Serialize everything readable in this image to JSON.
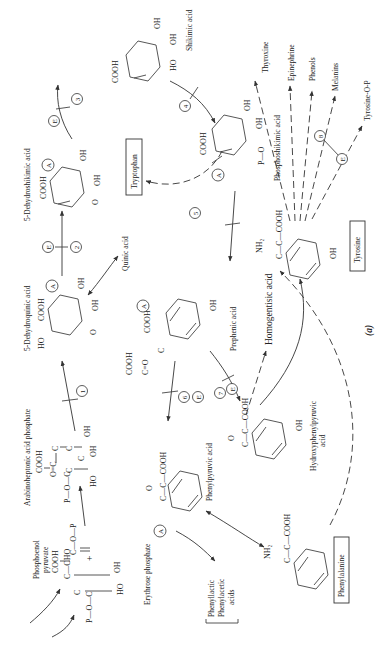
{
  "figure": {
    "label": "(a)",
    "orientation": "rotated 90 degrees counter-clockwise"
  },
  "compounds": {
    "erythrose_phosphate": {
      "name": "Erythrose phosphate",
      "formula": [
        "P—O—C",
        "C",
        "C—CHO",
        "HO",
        "OH"
      ]
    },
    "phosphoenol_pyruvate": {
      "name_line1": "Phosphoenol",
      "name_line2": "pyruvate",
      "formula": [
        "COOH",
        "C—O—P",
        "C"
      ]
    },
    "plus": "+",
    "arabinoheptonic": {
      "name": "Arabinoheptonic acid phosphate",
      "formula": [
        "COOH",
        "O=C",
        "C",
        "P—O—C",
        "C",
        "C",
        "C",
        "HO",
        "OH",
        "OH"
      ]
    },
    "dehydroquinic": {
      "name": "5-Dehydroquinic acid",
      "formula": [
        "HO",
        "COOH",
        "OH",
        "OH",
        "O"
      ]
    },
    "dehydroshikimic": {
      "name": "5-Dehydroshikimic acid",
      "formula": [
        "COOH",
        "OH",
        "OH",
        "O"
      ]
    },
    "shikimic": {
      "name": "Shikimic acid",
      "formula": [
        "COOH",
        "OH",
        "OH",
        "HO"
      ]
    },
    "quinic": {
      "name": "Quinic acid"
    },
    "tryptophan": {
      "name": "Tryptophan"
    },
    "phosphoshikimic": {
      "name": "Phosphoshikimic acid",
      "formula": [
        "COOH",
        "OH",
        "OH",
        "P—O"
      ]
    },
    "prephenic": {
      "name": "Prephenic acid",
      "formula": [
        "COOH",
        "C=O",
        "C",
        "COOH",
        "OH"
      ]
    },
    "phenylpyruvic": {
      "name": "Phenylpyruvic acid",
      "formula": [
        "C—C—COOH",
        "O"
      ]
    },
    "hydroxyphenylpyruvic": {
      "name_line1": "Hydroxyphenylpyruvic",
      "name_line2": "acid",
      "formula": [
        "C—C—COOH",
        "O",
        "OH"
      ]
    },
    "homogentisic": {
      "name": "Homogentisic acid"
    },
    "phenyllactic": {
      "line1": "Phenyllactic",
      "line2": "Phenylacetic",
      "line3": "acids"
    },
    "phenylalanine": {
      "name": "Phenylalanine",
      "formula": [
        "NH₂",
        "C—C—COOH"
      ]
    },
    "tyrosine": {
      "name": "Tyrosine",
      "formula": [
        "NH₂",
        "C—C—COOH",
        "OH"
      ]
    }
  },
  "products": [
    "Thyroxine",
    "Epinephrine",
    "Phenols",
    "Melanins",
    "Tyrosine-O-P"
  ],
  "steps": [
    "1",
    "2",
    "3",
    "4",
    "5",
    "6",
    "7",
    "8"
  ],
  "markers": {
    "A": "A",
    "E": "E"
  },
  "colors": {
    "ink": "#222222",
    "background": "#ffffff"
  }
}
